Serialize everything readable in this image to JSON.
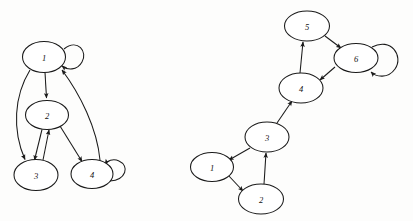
{
  "figure": {
    "kind": "directed-graph-pair",
    "background_color": "#fdfdfc",
    "stroke_color": "#1a1a1a",
    "node_fill_color": "#ffffff",
    "width": 413,
    "height": 221
  },
  "graphs": [
    {
      "id": "left-graph",
      "name": "left-directed-graph",
      "nodes": [
        {
          "id": "L1",
          "label": "1",
          "cx": 44,
          "cy": 57,
          "rx": 21.5,
          "ry": 15.5
        },
        {
          "id": "L2",
          "label": "2",
          "cx": 47,
          "cy": 115,
          "rx": 21.5,
          "ry": 14.5
        },
        {
          "id": "L3",
          "label": "3",
          "cx": 36,
          "cy": 175,
          "rx": 22.0,
          "ry": 15.5
        },
        {
          "id": "L4",
          "label": "4",
          "cx": 92,
          "cy": 174,
          "rx": 21.0,
          "ry": 14.5
        }
      ],
      "edges": [
        {
          "from": "1",
          "to": "1",
          "type": "self-loop"
        },
        {
          "from": "1",
          "to": "2",
          "type": "straight"
        },
        {
          "from": "1",
          "to": "3",
          "type": "curved"
        },
        {
          "from": "2",
          "to": "3",
          "type": "straight"
        },
        {
          "from": "3",
          "to": "2",
          "type": "straight"
        },
        {
          "from": "2",
          "to": "4",
          "type": "straight"
        },
        {
          "from": "4",
          "to": "1",
          "type": "curved"
        },
        {
          "from": "4",
          "to": "4",
          "type": "self-loop"
        }
      ]
    },
    {
      "id": "right-graph",
      "name": "right-directed-graph",
      "nodes": [
        {
          "id": "R1",
          "label": "1",
          "cx": 212,
          "cy": 167,
          "rx": 21.5,
          "ry": 14.5
        },
        {
          "id": "R2",
          "label": "2",
          "cx": 261,
          "cy": 199,
          "rx": 22.5,
          "ry": 15.0
        },
        {
          "id": "R3",
          "label": "3",
          "cx": 267,
          "cy": 137,
          "rx": 22.0,
          "ry": 15.0
        },
        {
          "id": "R4",
          "label": "4",
          "cx": 301,
          "cy": 88,
          "rx": 22.0,
          "ry": 15.0
        },
        {
          "id": "R5",
          "label": "5",
          "cx": 307,
          "cy": 26,
          "rx": 22.5,
          "ry": 15.0
        },
        {
          "id": "R6",
          "label": "6",
          "cx": 356,
          "cy": 58,
          "rx": 22.0,
          "ry": 14.5
        }
      ],
      "edges": [
        {
          "from": "1",
          "to": "2",
          "type": "straight"
        },
        {
          "from": "2",
          "to": "3",
          "type": "straight"
        },
        {
          "from": "3",
          "to": "1",
          "type": "straight"
        },
        {
          "from": "3",
          "to": "4",
          "type": "straight"
        },
        {
          "from": "4",
          "to": "5",
          "type": "straight"
        },
        {
          "from": "5",
          "to": "6",
          "type": "straight"
        },
        {
          "from": "6",
          "to": "4",
          "type": "straight"
        },
        {
          "from": "6",
          "to": "6",
          "type": "self-loop"
        }
      ]
    }
  ]
}
